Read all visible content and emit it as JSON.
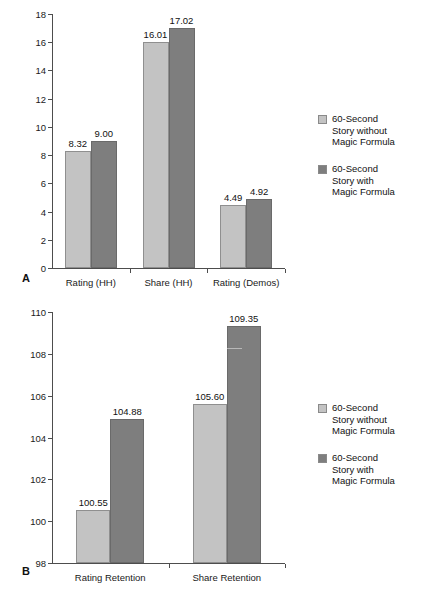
{
  "figure": {
    "background": "#ffffff",
    "colors": {
      "series_light": "#c3c3c3",
      "series_dark": "#7e7e7e",
      "axis": "#4d4d4d",
      "text": "#1a1a1a"
    },
    "legend_entries": [
      {
        "swatch": "light",
        "label": "60-Second\nStory without\nMagic Formula"
      },
      {
        "swatch": "dark",
        "label": "60-Second\nStory with\nMagic Formula"
      }
    ]
  },
  "panel_a": {
    "letter": "A",
    "chart_data": {
      "type": "bar",
      "title": "",
      "xlabel": "",
      "ylabel": "",
      "ylim": [
        0,
        18
      ],
      "yticks": [
        0,
        2,
        4,
        6,
        8,
        10,
        12,
        14,
        16,
        18
      ],
      "ytick_labels": [
        "0",
        "2",
        "4",
        "6",
        "8",
        "10",
        "12",
        "14",
        "16",
        "18"
      ],
      "grid": false,
      "legend_position": "right",
      "categories": [
        "Rating (HH)",
        "Share (HH)",
        "Rating (Demos)"
      ],
      "series": [
        {
          "name": "60-Second Story without Magic Formula",
          "color": "#c3c3c3",
          "values": [
            8.32,
            16.01,
            4.49
          ],
          "value_labels": [
            "8.32",
            "16.01",
            "4.49"
          ]
        },
        {
          "name": "60-Second Story with Magic Formula",
          "color": "#7e7e7e",
          "values": [
            9.0,
            17.02,
            4.92
          ],
          "value_labels": [
            "9.00",
            "17.02",
            "4.92"
          ]
        }
      ]
    }
  },
  "panel_b": {
    "letter": "B",
    "chart_data": {
      "type": "bar",
      "title": "",
      "xlabel": "",
      "ylabel": "",
      "ylim": [
        98,
        110
      ],
      "yticks": [
        98,
        100,
        102,
        104,
        106,
        108,
        110
      ],
      "ytick_labels": [
        "98",
        "100",
        "102",
        "104",
        "106",
        "108",
        "110"
      ],
      "grid": false,
      "legend_position": "right",
      "categories": [
        "Rating Retention",
        "Share Retention"
      ],
      "series": [
        {
          "name": "60-Second Story without Magic Formula",
          "color": "#c3c3c3",
          "values": [
            100.55,
            105.6
          ],
          "value_labels": [
            "100.55",
            "105.60"
          ]
        },
        {
          "name": "60-Second Story with Magic Formula",
          "color": "#7e7e7e",
          "values": [
            104.88,
            109.35
          ],
          "value_labels": [
            "104.88",
            "109.35"
          ]
        }
      ]
    }
  }
}
